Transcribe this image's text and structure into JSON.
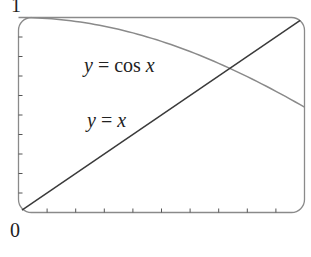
{
  "chart_data": {
    "type": "line",
    "title": "",
    "xlabel": "",
    "ylabel": "",
    "xlim": [
      0,
      1
    ],
    "ylim": [
      0,
      1
    ],
    "grid": false,
    "legend": "none",
    "y_tick_labels": {
      "top": "1",
      "bottom": "0"
    },
    "x_minor_ticks": 9,
    "y_minor_ticks": 9,
    "series": [
      {
        "name": "y = cos x",
        "label_parts": [
          "y",
          " = cos ",
          "x"
        ],
        "function": "cos(x)",
        "color": "#8a8a8a",
        "x": [
          0,
          0.1,
          0.2,
          0.3,
          0.4,
          0.5,
          0.6,
          0.7,
          0.8,
          0.9,
          1.0
        ],
        "values": [
          1.0,
          0.995,
          0.98,
          0.955,
          0.921,
          0.878,
          0.825,
          0.765,
          0.697,
          0.622,
          0.54
        ]
      },
      {
        "name": "y = x",
        "label_parts": [
          "y",
          " = ",
          "x"
        ],
        "function": "x",
        "color": "#3a3a3a",
        "x": [
          0,
          1
        ],
        "values": [
          0,
          1
        ]
      }
    ],
    "annotations": [
      {
        "text": "y = cos x",
        "near": "upper-middle"
      },
      {
        "text": "y = x",
        "near": "middle-left"
      }
    ],
    "intersection": {
      "x": 0.739,
      "y": 0.739
    }
  },
  "labels": {
    "y_top": "1",
    "y_bottom": "0",
    "cos_y": "y",
    "cos_mid": " = cos ",
    "cos_x": "x",
    "lin_y": "y",
    "lin_mid": " = ",
    "lin_x": "x"
  },
  "colors": {
    "frame": "#8a8a8a",
    "cos_curve": "#8a8a8a",
    "line": "#3a3a3a",
    "ticks": "#555555"
  }
}
